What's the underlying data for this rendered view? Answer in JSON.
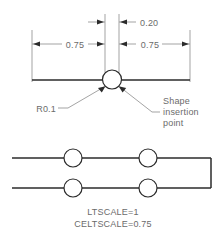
{
  "drawing": {
    "title": "Shape insertion point detail",
    "dimensions": [
      {
        "id": "left-span",
        "label": "0.75"
      },
      {
        "id": "gap",
        "label": "0.20"
      },
      {
        "id": "right-span",
        "label": "0.75"
      }
    ],
    "callouts": [
      {
        "id": "radius",
        "label": "R0.1"
      },
      {
        "id": "insertion-point",
        "lines": [
          "Shape",
          "insertion",
          "point"
        ]
      }
    ],
    "notes": [
      {
        "id": "ltscale",
        "label": "LTSCALE=1"
      },
      {
        "id": "celtscale",
        "label": "CELTSCALE=0.75"
      }
    ],
    "colors": {
      "object_line": "#2b2b2b",
      "dimension_line": "#7d7d7d",
      "text": "#6b6b6b",
      "background": "#ffffff"
    }
  }
}
